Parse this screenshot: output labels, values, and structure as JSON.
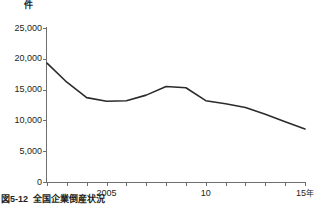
{
  "figure": {
    "caption_number": "図5-12",
    "caption_title": "全国企業倒産状況",
    "unit_label": "件"
  },
  "chart_data": {
    "type": "line",
    "title": "全国企業倒産状況",
    "xlabel": "",
    "ylabel": "件",
    "ylim": [
      0,
      25000
    ],
    "xlim": [
      2002,
      2015
    ],
    "grid": false,
    "legend": false,
    "y_ticks": [
      0,
      5000,
      10000,
      15000,
      20000,
      25000
    ],
    "y_tick_labels": [
      "0",
      "5,000",
      "10,000",
      "15,000",
      "20,000",
      "25,000"
    ],
    "x_ticks": [
      2002,
      2003,
      2004,
      2005,
      2006,
      2007,
      2008,
      2009,
      2010,
      2011,
      2012,
      2013,
      2014,
      2015
    ],
    "x_tick_labels": [
      {
        "x": 2005,
        "label": "2005",
        "suffix": ""
      },
      {
        "x": 2010,
        "label": "10",
        "suffix": ""
      },
      {
        "x": 2015,
        "label": "15",
        "suffix": "年"
      }
    ],
    "line_color": "#2b2b2b",
    "line_width": 1.6,
    "x": [
      2002,
      2003,
      2004,
      2005,
      2006,
      2007,
      2008,
      2009,
      2010,
      2011,
      2012,
      2013,
      2014,
      2015
    ],
    "values": [
      19300,
      16200,
      13700,
      13100,
      13200,
      14100,
      15500,
      15300,
      13200,
      12700,
      12100,
      11000,
      9800,
      8600
    ],
    "series": [
      {
        "name": "倒産件数",
        "values": [
          19300,
          16200,
          13700,
          13100,
          13200,
          14100,
          15500,
          15300,
          13200,
          12700,
          12100,
          11000,
          9800,
          8600
        ]
      }
    ]
  }
}
